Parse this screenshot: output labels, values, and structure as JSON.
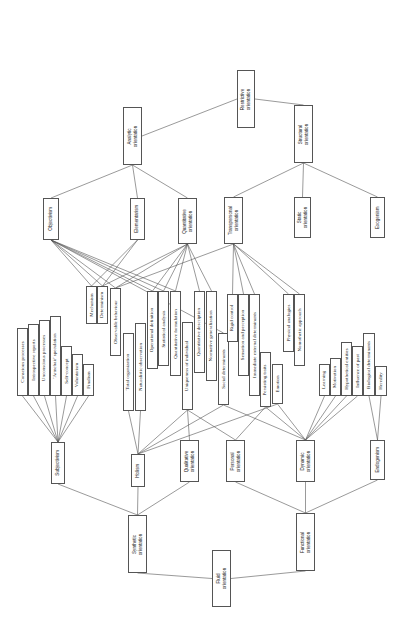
{
  "diagram": {
    "orientation": "rotated-90",
    "nodes": [
      {
        "id": "restrictive",
        "label": "Restrictive\norientation",
        "x": 237,
        "y": 70,
        "w": 18,
        "h": 58,
        "sans": true
      },
      {
        "id": "analytic",
        "label": "Analytic\norientation",
        "x": 123,
        "y": 107,
        "w": 19,
        "h": 58,
        "sans": true
      },
      {
        "id": "structural",
        "label": "Structural\norientation",
        "x": 294,
        "y": 105,
        "w": 19,
        "h": 58,
        "sans": true
      },
      {
        "id": "objectivism",
        "label": "Objectivism",
        "x": 43,
        "y": 198,
        "w": 16,
        "h": 42,
        "sans": true
      },
      {
        "id": "elementarism",
        "label": "Elementarism",
        "x": 130,
        "y": 198,
        "w": 15,
        "h": 42,
        "sans": true
      },
      {
        "id": "quantitative",
        "label": "Quantitative\norientation",
        "x": 178,
        "y": 198,
        "w": 19,
        "h": 46,
        "sans": true
      },
      {
        "id": "transpersonal",
        "label": "Transpersonal\norientation",
        "x": 224,
        "y": 197,
        "w": 19,
        "h": 47,
        "sans": true
      },
      {
        "id": "static",
        "label": "Static\norientation",
        "x": 294,
        "y": 197,
        "w": 17,
        "h": 41,
        "sans": true
      },
      {
        "id": "exogenism",
        "label": "Exogenism",
        "x": 370,
        "y": 197,
        "w": 15,
        "h": 41,
        "sans": true
      },
      {
        "id": "mechanism",
        "label": "Mechanism",
        "x": 86,
        "y": 286,
        "w": 11,
        "h": 38
      },
      {
        "id": "determinism",
        "label": "Determinism",
        "x": 97,
        "y": 286,
        "w": 11,
        "h": 38
      },
      {
        "id": "observable",
        "label": "Observable behaviour",
        "x": 110,
        "y": 288,
        "w": 11,
        "h": 68
      },
      {
        "id": "totalorg",
        "label": "Total organization",
        "x": 123,
        "y": 333,
        "w": 11,
        "h": 78
      },
      {
        "id": "naturalistic",
        "label": "Naturalistic observation",
        "x": 135,
        "y": 323,
        "w": 11,
        "h": 88
      },
      {
        "id": "opdef",
        "label": "Operational definition",
        "x": 147,
        "y": 291,
        "w": 11,
        "h": 78
      },
      {
        "id": "statanalysis",
        "label": "Statistical analysis",
        "x": 158,
        "y": 291,
        "w": 11,
        "h": 75
      },
      {
        "id": "quantform",
        "label": "Quantitative formulation",
        "x": 170,
        "y": 291,
        "w": 11,
        "h": 85
      },
      {
        "id": "uniqueness",
        "label": "Uniqueness of individual",
        "x": 182,
        "y": 322,
        "w": 11,
        "h": 88
      },
      {
        "id": "quantdesc",
        "label": "Quantitative description",
        "x": 194,
        "y": 291,
        "w": 11,
        "h": 82
      },
      {
        "id": "normgen",
        "label": "Normative generalization",
        "x": 206,
        "y": 291,
        "w": 11,
        "h": 90
      },
      {
        "id": "socialdet",
        "label": "Social determinants",
        "x": 218,
        "y": 333,
        "w": 11,
        "h": 72
      },
      {
        "id": "rigidcontrol",
        "label": "Rigid control",
        "x": 227,
        "y": 294,
        "w": 11,
        "h": 48
      },
      {
        "id": "sensation",
        "label": "Sensation and perception",
        "x": 238,
        "y": 294,
        "w": 11,
        "h": 82
      },
      {
        "id": "immediate",
        "label": "Immediate external determinants",
        "x": 249,
        "y": 294,
        "w": 11,
        "h": 102
      },
      {
        "id": "persisting",
        "label": "Persisting traits",
        "x": 260,
        "y": 352,
        "w": 11,
        "h": 55
      },
      {
        "id": "emotion",
        "label": "Emotion",
        "x": 272,
        "y": 364,
        "w": 11,
        "h": 40
      },
      {
        "id": "physanalogies",
        "label": "Physical analogies",
        "x": 283,
        "y": 294,
        "w": 11,
        "h": 58
      },
      {
        "id": "nomothetic",
        "label": "Nomothetic approach",
        "x": 294,
        "y": 294,
        "w": 11,
        "h": 72
      },
      {
        "id": "conscious",
        "label": "Conscious processes",
        "x": 17,
        "y": 328,
        "w": 11,
        "h": 68
      },
      {
        "id": "introspective",
        "label": "Introspective reports",
        "x": 28,
        "y": 324,
        "w": 11,
        "h": 72
      },
      {
        "id": "unconscious",
        "label": "Unconscious processes",
        "x": 39,
        "y": 320,
        "w": 11,
        "h": 76
      },
      {
        "id": "armchair",
        "label": "'Armchair' speculation",
        "x": 50,
        "y": 316,
        "w": 11,
        "h": 80
      },
      {
        "id": "selfconcept",
        "label": "Self-concept",
        "x": 61,
        "y": 346,
        "w": 11,
        "h": 50
      },
      {
        "id": "voluntarism",
        "label": "Voluntarism",
        "x": 72,
        "y": 354,
        "w": 11,
        "h": 42
      },
      {
        "id": "finalism",
        "label": "Finalism",
        "x": 83,
        "y": 364,
        "w": 11,
        "h": 32
      },
      {
        "id": "learning",
        "label": "Learning",
        "x": 319,
        "y": 364,
        "w": 11,
        "h": 32
      },
      {
        "id": "motivation",
        "label": "Motivation",
        "x": 330,
        "y": 358,
        "w": 11,
        "h": 38
      },
      {
        "id": "hypothetical",
        "label": "Hypothetical entities",
        "x": 341,
        "y": 342,
        "w": 11,
        "h": 54
      },
      {
        "id": "influencepast",
        "label": "Influence of past",
        "x": 352,
        "y": 346,
        "w": 11,
        "h": 50
      },
      {
        "id": "biological",
        "label": "Biological determinants",
        "x": 363,
        "y": 333,
        "w": 12,
        "h": 63
      },
      {
        "id": "heredity",
        "label": "Heredity",
        "x": 375,
        "y": 366,
        "w": 12,
        "h": 30
      },
      {
        "id": "subjectivism",
        "label": "Subjectivism",
        "x": 51,
        "y": 442,
        "w": 14,
        "h": 42,
        "sans": true
      },
      {
        "id": "holism",
        "label": "Holism",
        "x": 131,
        "y": 454,
        "w": 14,
        "h": 33,
        "sans": true
      },
      {
        "id": "qualitative",
        "label": "Qualitative\norientation",
        "x": 180,
        "y": 440,
        "w": 19,
        "h": 42,
        "sans": true
      },
      {
        "id": "personal",
        "label": "Personal\norientation",
        "x": 226,
        "y": 440,
        "w": 19,
        "h": 42,
        "sans": true
      },
      {
        "id": "dynamic",
        "label": "Dynamic\norientation",
        "x": 296,
        "y": 440,
        "w": 19,
        "h": 42,
        "sans": true
      },
      {
        "id": "endogenism",
        "label": "Endogenism",
        "x": 370,
        "y": 440,
        "w": 15,
        "h": 40,
        "sans": true
      },
      {
        "id": "synthetic",
        "label": "Synthetic\norientation",
        "x": 128,
        "y": 515,
        "w": 19,
        "h": 58,
        "sans": true
      },
      {
        "id": "functional",
        "label": "Functional\norientation",
        "x": 296,
        "y": 513,
        "w": 19,
        "h": 58,
        "sans": true
      },
      {
        "id": "fluid",
        "label": "Fluid\norientation",
        "x": 212,
        "y": 550,
        "w": 19,
        "h": 57,
        "sans": true
      }
    ],
    "edges": [
      [
        "restrictive",
        "analytic",
        "L",
        "R"
      ],
      [
        "restrictive",
        "structural",
        "R",
        "T"
      ],
      [
        "analytic",
        "objectivism",
        "B",
        "T"
      ],
      [
        "analytic",
        "elementarism",
        "B",
        "T"
      ],
      [
        "analytic",
        "quantitative",
        "B",
        "T"
      ],
      [
        "structural",
        "transpersonal",
        "B",
        "T"
      ],
      [
        "structural",
        "static",
        "B",
        "T"
      ],
      [
        "structural",
        "exogenism",
        "B",
        "T"
      ],
      [
        "objectivism",
        "mechanism",
        "B",
        "T"
      ],
      [
        "objectivism",
        "determinism",
        "B",
        "T"
      ],
      [
        "objectivism",
        "observable",
        "B",
        "T"
      ],
      [
        "objectivism",
        "opdef",
        "B",
        "T"
      ],
      [
        "objectivism",
        "statanalysis",
        "B",
        "T"
      ],
      [
        "objectivism",
        "quantform",
        "B",
        "T"
      ],
      [
        "objectivism",
        "socialdet",
        "B",
        "T"
      ],
      [
        "elementarism",
        "mechanism",
        "B",
        "T"
      ],
      [
        "elementarism",
        "determinism",
        "B",
        "T"
      ],
      [
        "quantitative",
        "observable",
        "B",
        "T"
      ],
      [
        "quantitative",
        "opdef",
        "B",
        "T"
      ],
      [
        "quantitative",
        "statanalysis",
        "B",
        "T"
      ],
      [
        "quantitative",
        "quantform",
        "B",
        "T"
      ],
      [
        "quantitative",
        "quantdesc",
        "B",
        "T"
      ],
      [
        "quantitative",
        "normgen",
        "B",
        "T"
      ],
      [
        "quantitative",
        "determinism",
        "B",
        "T"
      ],
      [
        "transpersonal",
        "rigidcontrol",
        "B",
        "T"
      ],
      [
        "transpersonal",
        "sensation",
        "B",
        "T"
      ],
      [
        "transpersonal",
        "immediate",
        "B",
        "T"
      ],
      [
        "transpersonal",
        "physanalogies",
        "B",
        "T"
      ],
      [
        "transpersonal",
        "nomothetic",
        "B",
        "T"
      ],
      [
        "transpersonal",
        "observable",
        "B",
        "T"
      ],
      [
        "subjectivism",
        "conscious",
        "T",
        "B"
      ],
      [
        "subjectivism",
        "introspective",
        "T",
        "B"
      ],
      [
        "subjectivism",
        "unconscious",
        "T",
        "B"
      ],
      [
        "subjectivism",
        "armchair",
        "T",
        "B"
      ],
      [
        "subjectivism",
        "selfconcept",
        "T",
        "B"
      ],
      [
        "subjectivism",
        "voluntarism",
        "T",
        "B"
      ],
      [
        "subjectivism",
        "finalism",
        "T",
        "B"
      ],
      [
        "holism",
        "totalorg",
        "T",
        "B"
      ],
      [
        "holism",
        "naturalistic",
        "T",
        "B"
      ],
      [
        "holism",
        "uniqueness",
        "T",
        "B"
      ],
      [
        "holism",
        "socialdet",
        "T",
        "B"
      ],
      [
        "holism",
        "emotion",
        "T",
        "B"
      ],
      [
        "qualitative",
        "uniqueness",
        "T",
        "B"
      ],
      [
        "personal",
        "uniqueness",
        "T",
        "B"
      ],
      [
        "personal",
        "persisting",
        "T",
        "B"
      ],
      [
        "dynamic",
        "learning",
        "T",
        "B"
      ],
      [
        "dynamic",
        "motivation",
        "T",
        "B"
      ],
      [
        "dynamic",
        "hypothetical",
        "T",
        "B"
      ],
      [
        "dynamic",
        "influencepast",
        "T",
        "B"
      ],
      [
        "dynamic",
        "socialdet",
        "T",
        "B"
      ],
      [
        "dynamic",
        "persisting",
        "T",
        "B"
      ],
      [
        "dynamic",
        "emotion",
        "T",
        "B"
      ],
      [
        "endogenism",
        "biological",
        "T",
        "B"
      ],
      [
        "endogenism",
        "heredity",
        "T",
        "B"
      ],
      [
        "synthetic",
        "subjectivism",
        "T",
        "B"
      ],
      [
        "synthetic",
        "holism",
        "T",
        "B"
      ],
      [
        "synthetic",
        "qualitative",
        "T",
        "B"
      ],
      [
        "functional",
        "personal",
        "T",
        "B"
      ],
      [
        "functional",
        "dynamic",
        "T",
        "B"
      ],
      [
        "functional",
        "endogenism",
        "T",
        "B"
      ],
      [
        "fluid",
        "synthetic",
        "L",
        "B"
      ],
      [
        "fluid",
        "functional",
        "R",
        "B"
      ]
    ],
    "line_color": "#555555",
    "box_border_color": "#555555"
  }
}
